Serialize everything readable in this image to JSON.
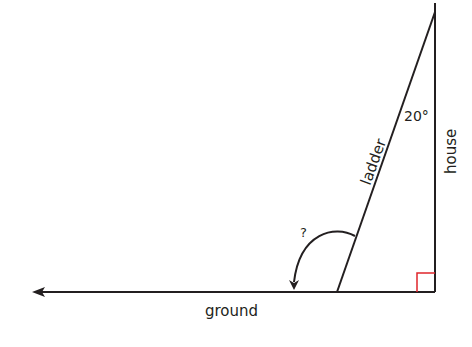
{
  "diagram": {
    "labels": {
      "ladder": "ladder",
      "house": "house",
      "ground": "ground",
      "angle_top": "20°",
      "angle_unknown": "?"
    },
    "colors": {
      "line": "#231f20",
      "right_angle": "#e0262b"
    }
  }
}
